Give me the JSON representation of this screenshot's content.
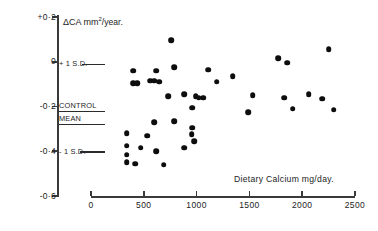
{
  "chart_data": {
    "type": "scatter",
    "title": "",
    "xlabel": "Dietary Calcium  mg/day.",
    "ylabel": "ΔCA mm2 /year.",
    "ylabel_prefix": "ΔCA mm",
    "ylabel_sup": "2",
    "ylabel_suffix": "/year.",
    "xlim": [
      0,
      2500
    ],
    "ylim": [
      -0.6,
      0.2
    ],
    "xticks": [
      0,
      500,
      1000,
      1500,
      2000,
      2500
    ],
    "xtick_labels": [
      "0",
      "500",
      "1000",
      "1500",
      "2000",
      "2500"
    ],
    "yticks": [
      0.2,
      0,
      -0.2,
      -0.4,
      -0.6
    ],
    "ytick_labels": [
      "+0·2",
      "0",
      "-0·2",
      "-0·4",
      "-0·6"
    ],
    "grid": false,
    "legend": "none",
    "marker": "filled-circle",
    "marker_color": "#0d0d0d",
    "annotations": [
      {
        "label": "+ 1 S.D.",
        "y": -0.01,
        "rule": true
      },
      {
        "label": "CONTROL",
        "y": -0.2,
        "rule": true
      },
      {
        "label": "MEAN",
        "y": -0.255,
        "rule": true
      },
      {
        "label": "- 1 S.D.",
        "y": -0.4,
        "rule": true
      }
    ],
    "points": [
      {
        "x": 760,
        "y": 0.095
      },
      {
        "x": 1770,
        "y": 0.015
      },
      {
        "x": 1860,
        "y": -0.005
      },
      {
        "x": 2250,
        "y": 0.055
      },
      {
        "x": 400,
        "y": -0.04
      },
      {
        "x": 620,
        "y": -0.04
      },
      {
        "x": 790,
        "y": -0.025
      },
      {
        "x": 1110,
        "y": -0.035
      },
      {
        "x": 1340,
        "y": -0.065
      },
      {
        "x": 400,
        "y": -0.095
      },
      {
        "x": 435,
        "y": -0.095
      },
      {
        "x": 560,
        "y": -0.085
      },
      {
        "x": 600,
        "y": -0.085
      },
      {
        "x": 645,
        "y": -0.09
      },
      {
        "x": 1190,
        "y": -0.09
      },
      {
        "x": 1530,
        "y": -0.15
      },
      {
        "x": 2060,
        "y": -0.145
      },
      {
        "x": 730,
        "y": -0.155
      },
      {
        "x": 880,
        "y": -0.145
      },
      {
        "x": 990,
        "y": -0.155
      },
      {
        "x": 1020,
        "y": -0.16
      },
      {
        "x": 1060,
        "y": -0.16
      },
      {
        "x": 1830,
        "y": -0.16
      },
      {
        "x": 2190,
        "y": -0.165
      },
      {
        "x": 960,
        "y": -0.205
      },
      {
        "x": 1490,
        "y": -0.225
      },
      {
        "x": 1910,
        "y": -0.21
      },
      {
        "x": 2300,
        "y": -0.215
      },
      {
        "x": 600,
        "y": -0.27
      },
      {
        "x": 790,
        "y": -0.265
      },
      {
        "x": 960,
        "y": -0.295
      },
      {
        "x": 340,
        "y": -0.32
      },
      {
        "x": 530,
        "y": -0.33
      },
      {
        "x": 955,
        "y": -0.325
      },
      {
        "x": 975,
        "y": -0.355
      },
      {
        "x": 340,
        "y": -0.375
      },
      {
        "x": 470,
        "y": -0.385
      },
      {
        "x": 620,
        "y": -0.4
      },
      {
        "x": 880,
        "y": -0.385
      },
      {
        "x": 340,
        "y": -0.415
      },
      {
        "x": 340,
        "y": -0.45
      },
      {
        "x": 420,
        "y": -0.455
      },
      {
        "x": 690,
        "y": -0.46
      }
    ]
  },
  "figure": {
    "axis_color": "#3a3a3a"
  }
}
